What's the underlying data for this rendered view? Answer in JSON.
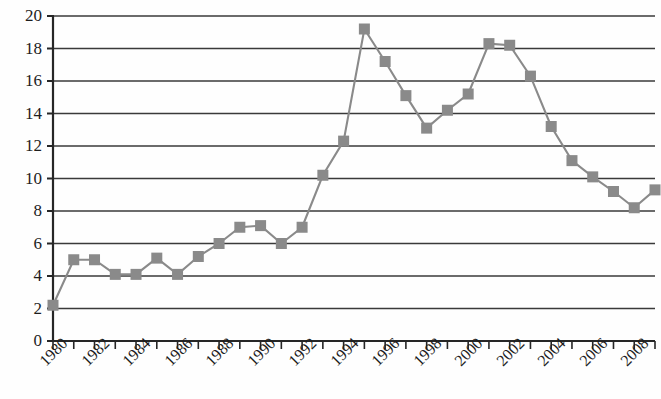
{
  "chart_data": {
    "type": "line",
    "title": "",
    "subtitle": "",
    "xlabel": "",
    "ylabel": "",
    "xlim": [
      1980,
      2009
    ],
    "ylim": [
      0,
      20
    ],
    "ytick_step": 2,
    "xtick_step": 1,
    "xlabel_step": 2,
    "grid": true,
    "legend": false,
    "legend_position": "none",
    "marker": "square",
    "marker_color": "#8a8a8a",
    "line_color": "#8a8a8a",
    "axis_color": "#262626",
    "grid_color": "#3a3a3a",
    "yticks": [
      0,
      2,
      4,
      6,
      8,
      10,
      12,
      14,
      16,
      18,
      20
    ],
    "ytick_labels": [
      "0",
      "2",
      "4",
      "6",
      "8",
      "10",
      "12",
      "14",
      "16",
      "18",
      "20"
    ],
    "xticks": [
      1980,
      1981,
      1982,
      1983,
      1984,
      1985,
      1986,
      1987,
      1988,
      1989,
      1990,
      1991,
      1992,
      1993,
      1994,
      1995,
      1996,
      1997,
      1998,
      1999,
      2000,
      2001,
      2002,
      2003,
      2004,
      2005,
      2006,
      2007,
      2008,
      2009
    ],
    "xtick_labels": [
      "1980",
      "1982",
      "1984",
      "1986",
      "1988",
      "1990",
      "1992",
      "1994",
      "1996",
      "1998",
      "2000",
      "2002",
      "2004",
      "2006",
      "2008"
    ],
    "x": [
      1980,
      1981,
      1982,
      1983,
      1984,
      1985,
      1986,
      1987,
      1988,
      1989,
      1990,
      1991,
      1992,
      1993,
      1994,
      1995,
      1996,
      1997,
      1998,
      1999,
      2000,
      2001,
      2002,
      2003,
      2004,
      2005,
      2006,
      2007,
      2008,
      2009
    ],
    "values": [
      2.2,
      5.0,
      5.0,
      4.1,
      4.1,
      5.1,
      4.1,
      5.2,
      6.0,
      7.0,
      7.1,
      6.0,
      7.0,
      10.2,
      12.3,
      19.2,
      17.2,
      15.1,
      13.1,
      14.2,
      15.2,
      18.3,
      18.2,
      16.3,
      13.2,
      11.1,
      10.1,
      9.2,
      8.2,
      9.3
    ]
  }
}
